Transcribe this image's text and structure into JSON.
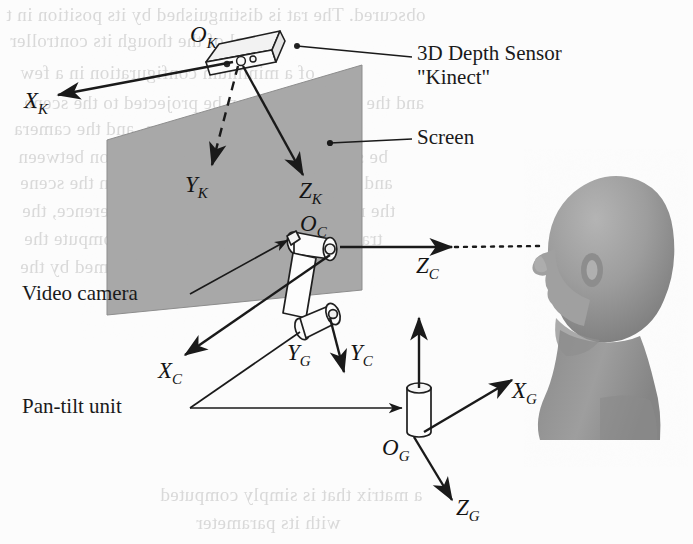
{
  "figure": {
    "background_color": "#fcfcfc",
    "ink_color": "#1a1a1a",
    "screen_fill": "#a8a8a8",
    "head_fill": "#9a9a9a",
    "ghost_color": "#d9d9d9"
  },
  "callouts": [
    {
      "id": "depth-sensor",
      "line1": "3D Depth Sensor",
      "line2": "\"Kinect\""
    },
    {
      "id": "screen",
      "label": "Screen"
    },
    {
      "id": "video-camera",
      "label": "Video camera"
    },
    {
      "id": "pan-tilt-unit",
      "label": "Pan-tilt unit"
    }
  ],
  "axis_labels": {
    "kinect": {
      "origin": {
        "base": "O",
        "sub": "K"
      },
      "x": {
        "base": "X",
        "sub": "K"
      },
      "y": {
        "base": "Y",
        "sub": "K"
      },
      "z": {
        "base": "Z",
        "sub": "K"
      }
    },
    "camera": {
      "origin": {
        "base": "O",
        "sub": "C"
      },
      "x": {
        "base": "X",
        "sub": "C"
      },
      "y": {
        "base": "Y",
        "sub": "C"
      },
      "z": {
        "base": "Z",
        "sub": "C"
      }
    },
    "global": {
      "origin": {
        "base": "O",
        "sub": "G"
      },
      "x": {
        "base": "X",
        "sub": "G"
      },
      "y": {
        "base": "Y",
        "sub": "G"
      },
      "z": {
        "base": "Z",
        "sub": "G"
      }
    }
  },
  "ghost_text": [
    {
      "text": "obscured. The rat is distinguished by its position in t",
      "x": 6,
      "y": 4
    },
    {
      "text": "level of the though its controller",
      "x": 10,
      "y": 30
    },
    {
      "text": "of a minimum configuration in a few",
      "x": 20,
      "y": 62
    },
    {
      "text": "and the global frame can be projected to the scene",
      "x": 24,
      "y": 92
    },
    {
      "text": "ration is known, and the camera",
      "x": 14,
      "y": 118
    },
    {
      "text": "be simple and relative transformation between",
      "x": 18,
      "y": 146
    },
    {
      "text": "and axis of all the transformations in the scene",
      "x": 20,
      "y": 172
    },
    {
      "text": "the relation in the main frame of reference, the",
      "x": 22,
      "y": 200
    },
    {
      "text": "transformation is defined and to compute the",
      "x": 24,
      "y": 228
    },
    {
      "text": "of the camera is now transformed by the",
      "x": 20,
      "y": 256
    },
    {
      "text": "a matrix that is simply computed",
      "x": 160,
      "y": 484
    },
    {
      "text": "with its parameter",
      "x": 196,
      "y": 512
    }
  ]
}
